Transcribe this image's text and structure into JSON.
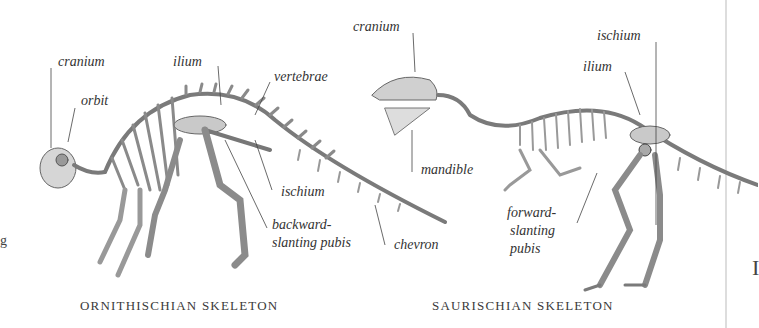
{
  "figures": [
    {
      "caption": "ORNITHISCHIAN SKELETON",
      "labels": {
        "cranium": "cranium",
        "orbit": "orbit",
        "ilium": "ilium",
        "vertebrae": "vertebrae",
        "ischium": "ischium",
        "pubis_line1": "backward-",
        "pubis_line2": "slanting pubis",
        "chevron": "chevron"
      }
    },
    {
      "caption": "SAURISCHIAN SKELETON",
      "labels": {
        "cranium": "cranium",
        "ischium": "ischium",
        "ilium": "ilium",
        "mandible": "mandible",
        "pubis_line1": "forward-",
        "pubis_line2": "slanting",
        "pubis_line3": "pubis"
      }
    }
  ],
  "edge": {
    "left_glyph": "g",
    "right_glyph": "I"
  }
}
